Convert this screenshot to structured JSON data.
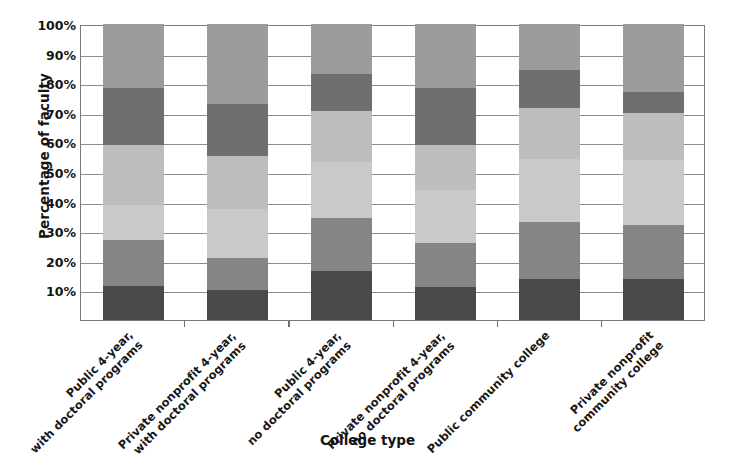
{
  "chart_data": {
    "type": "bar",
    "subtype": "stacked-bar-100",
    "title": "",
    "xlabel": "College type",
    "ylabel": "Percentage of faculty",
    "ylim": [
      0,
      100
    ],
    "y_tick_labels": [
      "10%",
      "20%",
      "30%",
      "40%",
      "50%",
      "60%",
      "70%",
      "80%",
      "90%",
      "100%"
    ],
    "y_tick_values": [
      10,
      20,
      30,
      40,
      50,
      60,
      70,
      80,
      90,
      100
    ],
    "grid": true,
    "legend": "none",
    "categories": [
      "Public 4-year,\nwith doctoral programs",
      "Private nonprofit 4-year,\nwith doctoral programs",
      "Public 4-year,\nno doctoral programs",
      "Private nonprofit 4-year,\nno doctoral programs",
      "Public community college",
      "Private nonprofit\ncommunity college"
    ],
    "category_lines": [
      [
        "Public 4-year,",
        "with doctoral programs"
      ],
      [
        "Private nonprofit 4-year,",
        "with doctoral programs"
      ],
      [
        "Public 4-year,",
        "no doctoral programs"
      ],
      [
        "Private nonprofit 4-year,",
        "no doctoral programs"
      ],
      [
        "Public community college"
      ],
      [
        "Private nonprofit",
        "community college"
      ]
    ],
    "series": [
      {
        "name": "segment-1",
        "color": "#4a4a4a",
        "values": [
          11.5,
          10.0,
          16.5,
          11.0,
          14.0,
          14.0
        ]
      },
      {
        "name": "segment-2",
        "color": "#858585",
        "values": [
          15.5,
          11.0,
          18.0,
          15.0,
          19.0,
          18.0
        ]
      },
      {
        "name": "segment-3",
        "color": "#c9c9c9",
        "values": [
          12.0,
          16.5,
          19.0,
          18.0,
          21.5,
          22.0
        ]
      },
      {
        "name": "segment-4",
        "color": "#bdbdbd",
        "values": [
          20.0,
          18.0,
          17.0,
          15.0,
          17.0,
          16.0
        ]
      },
      {
        "name": "segment-5",
        "color": "#6f6f6f",
        "values": [
          19.5,
          17.5,
          12.5,
          19.5,
          13.0,
          7.0
        ]
      },
      {
        "name": "segment-6",
        "color": "#9c9c9c",
        "values": [
          21.5,
          27.0,
          17.0,
          21.5,
          15.5,
          23.0
        ]
      }
    ],
    "cumulative_tops": [
      [
        11.5,
        27.0,
        39.0,
        59.0,
        78.5,
        100.0
      ],
      [
        10.0,
        21.0,
        37.5,
        55.5,
        73.0,
        100.0
      ],
      [
        16.5,
        34.5,
        53.5,
        70.5,
        83.0,
        100.0
      ],
      [
        11.0,
        26.0,
        44.0,
        59.0,
        78.5,
        100.0
      ],
      [
        14.0,
        33.0,
        54.5,
        71.5,
        84.5,
        100.0
      ],
      [
        14.0,
        32.0,
        54.0,
        70.0,
        77.0,
        100.0
      ]
    ]
  }
}
